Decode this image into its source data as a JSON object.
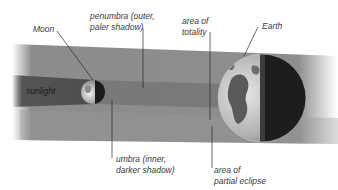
{
  "diagram": {
    "labels": {
      "moon": "Moon",
      "penumbra_line1": "penumbra (outer,",
      "penumbra_line2": "paler shadow)",
      "totality_line1": "area of",
      "totality_line2": "totality",
      "earth": "Earth",
      "sunlight": "sunlight",
      "umbra_line1": "umbra (inner,",
      "umbra_line2": "darker shadow)",
      "partial_line1": "area of",
      "partial_line2": "partial eclipse"
    },
    "colors": {
      "background": "#ffffff",
      "penumbra": "#8a8a8a",
      "umbra": "#555555",
      "earth_lit": "#c8c8c8",
      "earth_dark": "#1e1e1e",
      "leader_line": "#2a2a2a"
    }
  }
}
